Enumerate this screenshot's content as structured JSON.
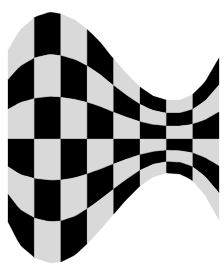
{
  "image": {
    "title": "Warped checkerboard",
    "width": 224,
    "height": 275,
    "background": "#ffffff",
    "colors": {
      "dark": "#000000",
      "light": "#d9d9d9"
    }
  },
  "caption": {
    "text": ""
  },
  "checkerboard": {
    "columns": 8,
    "rows": 6,
    "x_edges": [
      8,
      34.4,
      60.8,
      87.2,
      113.6,
      140,
      166.4,
      192.8,
      219
    ],
    "mid_line_y": 139,
    "top_row_first_column_color": "light",
    "top_curve": [
      [
        8,
        50
      ],
      [
        20,
        30
      ],
      [
        35,
        17
      ],
      [
        50,
        12
      ],
      [
        61,
        14
      ],
      [
        75,
        20
      ],
      [
        88,
        30
      ],
      [
        100,
        42
      ],
      [
        112,
        57
      ],
      [
        126,
        73
      ],
      [
        140,
        87
      ],
      [
        153,
        96
      ],
      [
        166,
        100
      ],
      [
        180,
        100
      ],
      [
        192,
        95
      ],
      [
        205,
        82
      ],
      [
        219,
        58
      ]
    ],
    "bottom_curve": [
      [
        8,
        222
      ],
      [
        20,
        245
      ],
      [
        35,
        258
      ],
      [
        50,
        263
      ],
      [
        61,
        262
      ],
      [
        75,
        255
      ],
      [
        88,
        243
      ],
      [
        100,
        230
      ],
      [
        112,
        216
      ],
      [
        126,
        200
      ],
      [
        140,
        186
      ],
      [
        153,
        177
      ],
      [
        166,
        173
      ],
      [
        180,
        174
      ],
      [
        192,
        180
      ],
      [
        205,
        195
      ],
      [
        219,
        220
      ]
    ]
  }
}
